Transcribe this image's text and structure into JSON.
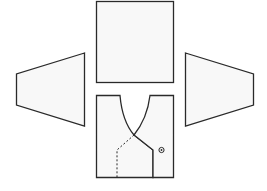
{
  "diagram": {
    "title": "",
    "type": "sewing-pattern-pieces",
    "colors": {
      "stroke": "#2a2a2a",
      "fill": "#f8f8f8",
      "background": "#ffffff"
    },
    "pieces": [
      {
        "name": "back-panel",
        "shape": "rectangle"
      },
      {
        "name": "left-sleeve",
        "shape": "trapezoid"
      },
      {
        "name": "right-sleeve",
        "shape": "trapezoid"
      },
      {
        "name": "front-panel",
        "shape": "rectangle-with-wrap-neckline",
        "details": [
          "dotted-underlap-line",
          "button-mark"
        ]
      }
    ]
  }
}
